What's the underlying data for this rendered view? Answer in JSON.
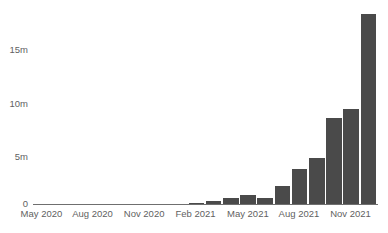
{
  "chart_data": {
    "type": "bar",
    "title": "",
    "subtitle": "",
    "xlabel": "",
    "ylabel": "",
    "ylim": [
      0,
      19.3
    ],
    "grid": false,
    "legend": false,
    "bar_color": "#4a4a4a",
    "axis_color": "#6f6f6f",
    "text_color": "#5f5f5f",
    "background": "#ffffff",
    "y_ticks": [
      {
        "value": 0,
        "label": "0"
      },
      {
        "value": 5,
        "label": "5m"
      },
      {
        "value": 10,
        "label": "10m"
      },
      {
        "value": 15,
        "label": "15m"
      }
    ],
    "x_ticks": [
      {
        "index": 0,
        "label": "May 2020"
      },
      {
        "index": 3,
        "label": "Aug 2020"
      },
      {
        "index": 6,
        "label": "Nov 2020"
      },
      {
        "index": 9,
        "label": "Feb 2021"
      },
      {
        "index": 12,
        "label": "May 2021"
      },
      {
        "index": 15,
        "label": "Aug 2021"
      },
      {
        "index": 18,
        "label": "Nov 2021"
      }
    ],
    "categories": [
      "May 2020",
      "Jun 2020",
      "Jul 2020",
      "Aug 2020",
      "Sep 2020",
      "Oct 2020",
      "Nov 2020",
      "Dec 2020",
      "Jan 2021",
      "Feb 2021",
      "Mar 2021",
      "Apr 2021",
      "May 2021",
      "Jun 2021",
      "Jul 2021",
      "Aug 2021",
      "Sep 2021",
      "Oct 2021",
      "Nov 2021",
      "Dec 2021"
    ],
    "values": [
      0.01,
      0.01,
      0.01,
      0.02,
      0.02,
      0.03,
      0.03,
      0.04,
      0.05,
      0.2,
      0.4,
      0.7,
      0.95,
      0.7,
      1.85,
      3.5,
      4.6,
      8.5,
      9.4,
      9.5
    ],
    "values_tail": 18.7,
    "units": "m",
    "value_note": "Values in millions"
  }
}
